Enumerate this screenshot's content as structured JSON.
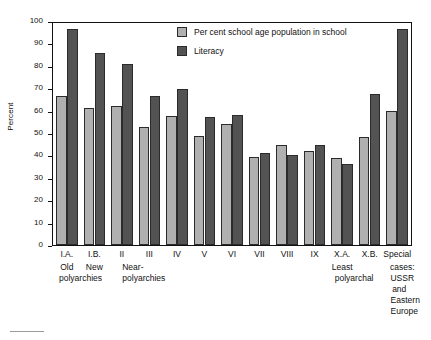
{
  "chart": {
    "type": "bar",
    "ylabel": "Percent",
    "y_ticks": [
      "100",
      "90",
      "80",
      "70",
      "60",
      "50",
      "40",
      "30",
      "20",
      "10",
      "0"
    ],
    "legend": [
      {
        "label": "Per cent school age population in school",
        "color": "#b0b0b0",
        "swatch": "legend-swatch-series0"
      },
      {
        "label": "Literacy",
        "color": "#535353",
        "swatch": "legend-swatch-series1"
      }
    ],
    "captions": [
      {
        "lines": "Old"
      },
      {
        "lines": "New"
      },
      {
        "lines": "polyarchies"
      },
      {
        "lines": "Near-"
      },
      {
        "lines": "polyarchies"
      },
      {
        "lines": "Least"
      },
      {
        "lines": "polyarchal"
      },
      {
        "lines": "cases:"
      },
      {
        "lines": "USSR"
      },
      {
        "lines": "and"
      },
      {
        "lines": "Eastern"
      },
      {
        "lines": "Europe"
      }
    ]
  },
  "chart_data": {
    "type": "bar",
    "title": "",
    "xlabel": "",
    "ylabel": "Percent",
    "ylim": [
      0,
      100
    ],
    "grid": false,
    "legend_position": "top-center",
    "y_ticks": [
      0,
      10,
      20,
      30,
      40,
      50,
      60,
      70,
      80,
      90,
      100
    ],
    "categories": [
      "I.A.",
      "I.B.",
      "II",
      "III",
      "IV",
      "V",
      "VI",
      "VII",
      "VIII",
      "IX",
      "X.A.",
      "X.B.",
      "Special cases: USSR and Eastern Europe"
    ],
    "category_sublabels": [
      "Old polyarchies",
      "New polyarchies",
      "Near-polyarchies",
      "",
      "",
      "",
      "",
      "",
      "",
      "",
      "Least polyarchal",
      "",
      "Special cases: USSR and Eastern Europe"
    ],
    "series": [
      {
        "name": "Per cent school age population in school",
        "color": "#b0b0b0",
        "values": [
          67,
          61.5,
          62.5,
          53,
          58,
          49,
          54.5,
          39.5,
          45,
          42.5,
          39,
          48.5,
          60.5
        ]
      },
      {
        "name": "Literacy",
        "color": "#535353",
        "values": [
          97.5,
          86.5,
          81.5,
          67,
          70.5,
          57.5,
          58.5,
          41.5,
          40.5,
          45,
          36.5,
          68,
          97.5
        ]
      }
    ]
  }
}
